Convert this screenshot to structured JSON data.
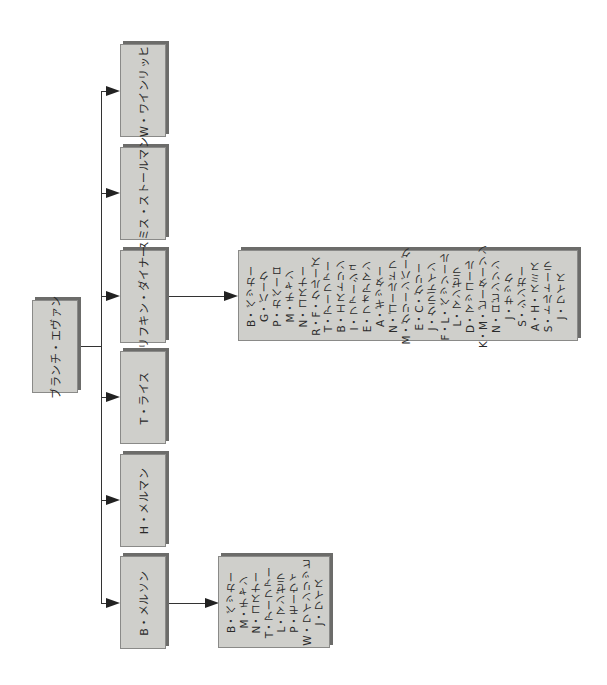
{
  "diagram": {
    "type": "org-chart",
    "orientation": "rotated-90-ccw",
    "colors": {
      "box_fill": "#cfcfcb",
      "box_border": "#8a8a88",
      "box_shadow": "#6c6c6a",
      "line": "#333333"
    },
    "root": {
      "label": "ブランチ・エヴァン"
    },
    "children": [
      {
        "label": "W・ワインリッヒ"
      },
      {
        "label": "スミス・ストールマン"
      },
      {
        "label": "リフキン・ダイナー"
      },
      {
        "label": "T・ライス"
      },
      {
        "label": "H・メルマン"
      },
      {
        "label": "B・メルソン"
      }
    ],
    "rifkin_list": [
      "B・ベッカー",
      "G・バーク",
      "P・カベーロ",
      "M・チャン",
      "N・コスナー",
      "R・F・クルーズ",
      "T・アーファー",
      "B・エストリン",
      "I・ファーシュ",
      "E・フォアマン",
      "A・ギッター",
      "N・ゴールドフ",
      "M・グリーンバーグ",
      "E・C・グリー",
      "J・クラデイン",
      "F・L・ベッソール",
      "L・マンゼラ",
      "D・マッコール",
      "K・M・ピーターソン",
      "N・ロビンソン",
      "J・サック",
      "S・シンガー",
      "A・H・スミス",
      "S・トルトーラ",
      "J・ワイス"
    ],
    "melson_list": [
      "B・ベッカー",
      "M・チャン",
      "N・コスナー",
      "T・アーファー",
      "L・マンゼラ",
      "P・モーウィ",
      "W・ワインリッヒ",
      "J・ワイス"
    ]
  }
}
